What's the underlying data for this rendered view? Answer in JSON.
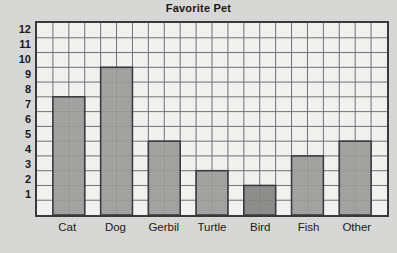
{
  "chart_data": {
    "type": "bar",
    "title": "Favorite Pet",
    "xlabel": "",
    "ylabel": "",
    "categories": [
      "Cat",
      "Dog",
      "Gerbil",
      "Turtle",
      "Bird",
      "Fish",
      "Other"
    ],
    "values": [
      7,
      9,
      4,
      2,
      1,
      3,
      4
    ],
    "ytick_labels": [
      "12",
      "11",
      "10",
      "9",
      "8",
      "7",
      "6",
      "5",
      "4",
      "3",
      "2",
      "1"
    ],
    "ylim": [
      0,
      13
    ],
    "yticks": [
      1,
      2,
      3,
      4,
      5,
      6,
      7,
      8,
      9,
      10,
      11,
      12
    ],
    "grid": true,
    "grid_columns": 22,
    "grid_rows": 13,
    "legend": "none",
    "bar_span_columns": 2,
    "bar_gap_columns": 1,
    "colors": {
      "bar_fill": "#9c9c9a",
      "bar_fill_highlight": "#868684",
      "bar_stroke": "#3c3c3c",
      "grid_line": "#6f6f6f",
      "axis_line": "#303030",
      "plot_background": "#f2f2f0",
      "page_background": "#d8d8d6",
      "text": "#1b1b1b"
    },
    "bars": [
      {
        "label": "Cat",
        "value": 7,
        "start_column": 1,
        "highlight": false
      },
      {
        "label": "Dog",
        "value": 9,
        "start_column": 4,
        "highlight": false
      },
      {
        "label": "Gerbil",
        "value": 4,
        "start_column": 7,
        "highlight": false
      },
      {
        "label": "Turtle",
        "value": 2,
        "start_column": 10,
        "highlight": false
      },
      {
        "label": "Bird",
        "value": 1,
        "start_column": 13,
        "highlight": true
      },
      {
        "label": "Fish",
        "value": 3,
        "start_column": 16,
        "highlight": false
      },
      {
        "label": "Other",
        "value": 4,
        "start_column": 19,
        "highlight": false
      }
    ]
  }
}
